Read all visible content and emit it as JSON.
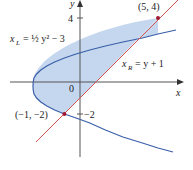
{
  "figure": {
    "axes": {
      "x_label": "x",
      "y_label": "y",
      "origin_label": "0",
      "y_ticks": [
        {
          "value": 4,
          "label": "4"
        },
        {
          "value": -2,
          "label": "−2"
        }
      ]
    },
    "curves": {
      "left": {
        "label_var": "x",
        "label_sub": "L",
        "label_eq": "= ½ y² − 3",
        "equation": "x_L = (1/2)y^2 - 3",
        "color": "#3a5fa8"
      },
      "right": {
        "label_var": "x",
        "label_sub": "R",
        "label_eq": "= y + 1",
        "equation": "x_R = y + 1",
        "color": "#d9534f"
      }
    },
    "points": [
      {
        "label": "(5, 4)",
        "x": 5,
        "y": 4
      },
      {
        "label": "(−1, −2)",
        "x": -1,
        "y": -2
      }
    ],
    "region_fill": "#c5d7ee",
    "point_color": "#a01830"
  }
}
